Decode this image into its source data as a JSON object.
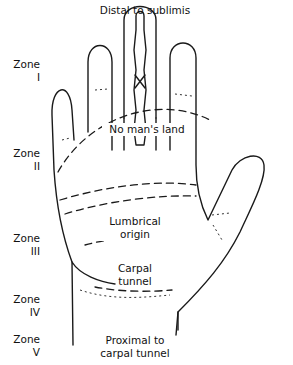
{
  "figure": {
    "title": "Distal to sublimis",
    "regions": [
      {
        "id": "no-mans-land",
        "label": "No man's land"
      },
      {
        "id": "lumbrical-origin",
        "label_line1": "Lumbrical",
        "label_line2": "origin"
      },
      {
        "id": "carpal-tunnel",
        "label_line1": "Carpal",
        "label_line2": "tunnel"
      },
      {
        "id": "proximal",
        "label_line1": "Proximal to",
        "label_line2": "carpal tunnel"
      }
    ],
    "zones": [
      {
        "word": "Zone",
        "numeral": "I"
      },
      {
        "word": "Zone",
        "numeral": "II"
      },
      {
        "word": "Zone",
        "numeral": "III"
      },
      {
        "word": "Zone",
        "numeral": "IV"
      },
      {
        "word": "Zone",
        "numeral": "V"
      }
    ]
  }
}
